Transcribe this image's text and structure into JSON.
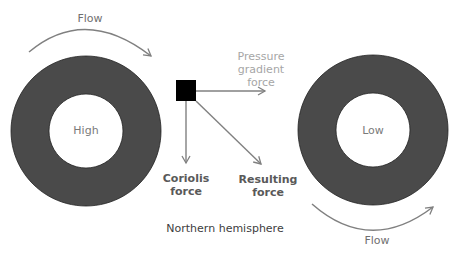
{
  "diagram": {
    "caption": "Northern hemisphere",
    "high_label": "High",
    "low_label": "Low",
    "flow_top_label": "Flow",
    "flow_bottom_label": "Flow",
    "pressure_gradient": {
      "line1": "Pressure",
      "line2": "gradient",
      "line3": "force"
    },
    "coriolis": {
      "line1": "Coriolis",
      "line2": "force"
    },
    "resulting": {
      "line1": "Resulting",
      "line2": "force"
    }
  },
  "colors": {
    "ring_fill": "#4a4a4a",
    "arrow": "#808080",
    "square": "#000000",
    "text_light": "#8c8c8c",
    "text_dark": "#595959"
  }
}
